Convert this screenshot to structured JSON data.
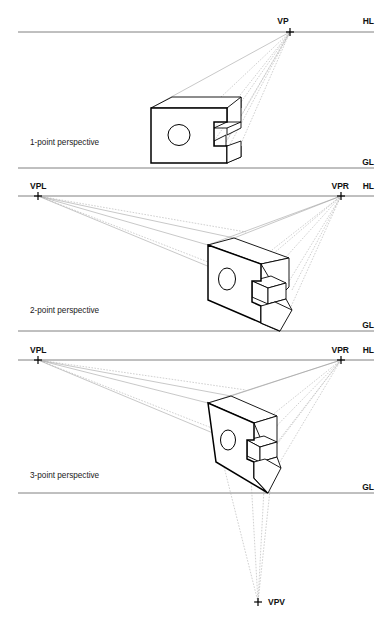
{
  "figure": {
    "width": 392,
    "height": 624,
    "background": "#ffffff",
    "line_color": "#808080",
    "object_color": "#000000",
    "ray_color": "#9a9a9a"
  },
  "panels": [
    {
      "id": "one-point",
      "caption": "1-point perspective",
      "horizon_label": "HL",
      "ground_label": "GL",
      "horizon_y": 32,
      "ground_y": 168,
      "vanishing_points": [
        {
          "name": "VP",
          "label": "VP",
          "x": 290,
          "y": 32
        }
      ]
    },
    {
      "id": "two-point",
      "caption": "2-point perspective",
      "horizon_label": "HL",
      "ground_label": "GL",
      "horizon_y": 196,
      "ground_y": 331,
      "vanishing_points": [
        {
          "name": "VPL",
          "label": "VPL",
          "x": 38,
          "y": 196
        },
        {
          "name": "VPR",
          "label": "VPR",
          "x": 341,
          "y": 196
        }
      ]
    },
    {
      "id": "three-point",
      "caption": "3-point perspective",
      "horizon_label": "HL",
      "ground_label": "GL",
      "horizon_y": 360,
      "ground_y": 493,
      "vanishing_points": [
        {
          "name": "VPL",
          "label": "VPL",
          "x": 38,
          "y": 360
        },
        {
          "name": "VPR",
          "label": "VPR",
          "x": 341,
          "y": 360
        },
        {
          "name": "VPV",
          "label": "VPV",
          "x": 258,
          "y": 602
        }
      ]
    }
  ],
  "labels": {
    "hl_1": "HL",
    "gl_1": "GL",
    "vp_1": "VP",
    "caption_1": "1-point perspective",
    "hl_2": "HL",
    "gl_2": "GL",
    "vpl_2": "VPL",
    "vpr_2": "VPR",
    "caption_2": "2-point perspective",
    "hl_3": "HL",
    "gl_3": "GL",
    "vpl_3": "VPL",
    "vpr_3": "VPR",
    "vpv_3": "VPV",
    "caption_3": "3-point perspective"
  },
  "object": {
    "description": "rectangular block with circular through-hole and stepped notch on right side",
    "features": [
      "circular-hole",
      "stepped-notch",
      "extruded-depth"
    ]
  }
}
